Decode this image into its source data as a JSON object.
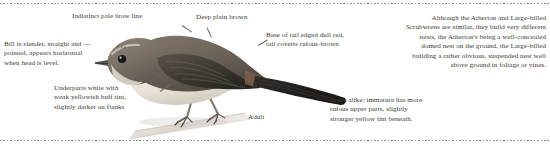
{
  "plate": {
    "subject": "Atherton Scrubwren",
    "stage_label": "Adult",
    "ink_color": "#3b3a38",
    "leader_color": "#6e6d6b",
    "rule_color": "#8f8f93",
    "background": "#ffffff"
  },
  "annotations": {
    "brow": "Indistinct pale brow line",
    "bill": "Bill is slender, straight and —\npointed, appears horizontal\nwhen head is level.",
    "back": "Deep plain brown",
    "tail": "Base of tail edged dull red,\ntail coverts rufous-brown",
    "underparts": "Underparts white with\nweak yellowish buff tint,\nslightly darker on flanks",
    "sexes": "Sexes alike; immature has more\nrufous upper parts, slightly\nstronger yellow tint beneath.",
    "nest": "Although the Atherton and Large-billed\nScrubwrens are similar, they build very different\nnests, the Atherton's being a well-concealed\ndomed nest on the ground, the Large-billed\nbuilding a rather obvious, suspended nest well\nabove ground in foliage or vines."
  },
  "illustration": {
    "name": "perched-scrubwren-illustration",
    "description": "Side view of a small brown scrubwren perched on a pale diagonal branch, facing left",
    "colors": {
      "upperparts": "#6b6258",
      "upperparts_dark": "#4a443c",
      "wing_dark": "#2e2b27",
      "tail_dark": "#232120",
      "underparts": "#ece7df",
      "flank_buff": "#d6cdbf",
      "bill": "#55504a",
      "eye": "#171615",
      "leg": "#8b857c",
      "branch": "#cfcac2"
    }
  }
}
